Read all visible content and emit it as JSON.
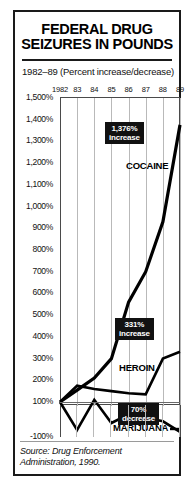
{
  "title": {
    "line1": "FEDERAL DRUG",
    "line2": "SEIZURES IN POUNDS"
  },
  "subtitle": "1982–89 (Percent increase/decrease)",
  "source": "Source: Drug Enforcement Administration, 1990.",
  "colors": {
    "ink": "#111111",
    "grid": "#b9b9b9",
    "callout_bg": "#111111",
    "callout_fg": "#ffffff"
  },
  "chart_data": {
    "type": "line",
    "title": "FEDERAL DRUG SEIZURES IN POUNDS",
    "subtitle": "1982–89 (Percent increase/decrease)",
    "xlabel": "",
    "ylabel": "",
    "grid": true,
    "legend": "inline-labels",
    "x": [
      1982,
      1983,
      1984,
      1985,
      1986,
      1987,
      1988,
      1989
    ],
    "categories": [
      "1982",
      "83",
      "84",
      "85",
      "86",
      "87",
      "88",
      "89"
    ],
    "ylim": [
      -100,
      1500
    ],
    "yticks": [
      1500,
      1400,
      1300,
      1200,
      1100,
      1000,
      900,
      800,
      700,
      600,
      500,
      400,
      300,
      200,
      100,
      -100
    ],
    "yticklabels": [
      "1,500%",
      "1,400%",
      "1,300%",
      "1,200%",
      "1,100%",
      "1,000%",
      "900%",
      "800%",
      "700%",
      "600%",
      "500%",
      "400%",
      "300%",
      "200%",
      "100%",
      "-100%"
    ],
    "series": [
      {
        "name": "COCAINE",
        "values": [
          100,
          155,
          210,
          300,
          560,
          700,
          930,
          1376
        ],
        "annotation": {
          "line1": "1,376%",
          "line2": "increase"
        }
      },
      {
        "name": "HEROIN",
        "values": [
          100,
          175,
          160,
          150,
          140,
          135,
          300,
          331
        ],
        "annotation": {
          "line1": "331%",
          "line2": "increase"
        }
      },
      {
        "name": "MARIJUANA",
        "values": [
          100,
          -60,
          110,
          -20,
          30,
          10,
          -10,
          -70
        ],
        "annotation": {
          "line1": "70%",
          "line2": "decrease"
        }
      }
    ]
  }
}
